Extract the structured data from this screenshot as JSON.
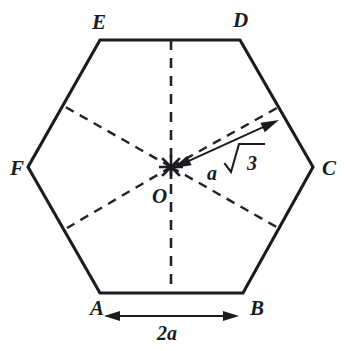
{
  "figure": {
    "shape": "regular-hexagon",
    "background_color": "#ffffff",
    "line_color": "#1b1b22"
  },
  "vertices": [
    {
      "key": "A",
      "label": "A",
      "x": 100,
      "y": 293,
      "label_x": 90,
      "label_y": 315
    },
    {
      "key": "B",
      "label": "B",
      "x": 243,
      "y": 293,
      "label_x": 250,
      "label_y": 315
    },
    {
      "key": "C",
      "label": "C",
      "x": 313,
      "y": 167,
      "label_x": 322,
      "label_y": 175
    },
    {
      "key": "D",
      "label": "D",
      "x": 240,
      "y": 40,
      "label_x": 233,
      "label_y": 27
    },
    {
      "key": "E",
      "label": "E",
      "x": 100,
      "y": 40,
      "label_x": 92,
      "label_y": 29
    },
    {
      "key": "F",
      "label": "F",
      "x": 28,
      "y": 167,
      "label_x": 10,
      "label_y": 175
    }
  ],
  "center": {
    "key": "O",
    "label": "O",
    "x": 171,
    "y": 167,
    "label_x": 152,
    "label_y": 203,
    "mark": "asterisk-cross"
  },
  "dimensions": {
    "base": {
      "label": "2a",
      "label_x": 157,
      "label_y": 340,
      "line_y": 316,
      "x_start": 104,
      "x_end": 239,
      "arrow": "double-headed"
    },
    "radius": {
      "label_a": "a",
      "label_radical": "√3",
      "label_full": "a √3",
      "label_x": 216,
      "label_y": 171,
      "from_x": 173,
      "from_y": 168,
      "to_x": 279,
      "to_y": 120,
      "arrow": "double-headed"
    }
  },
  "dashed_lines": [
    {
      "name": "vertical-axis",
      "x1": 171,
      "y1": 40,
      "x2": 171,
      "y2": 293
    },
    {
      "name": "diagonal-upper-left",
      "x1": 171,
      "y1": 167,
      "x2": 62,
      "y2": 105
    },
    {
      "name": "diagonal-lower-right",
      "x1": 171,
      "y1": 167,
      "x2": 280,
      "y2": 229
    },
    {
      "name": "diagonal-lower-left",
      "x1": 171,
      "y1": 167,
      "x2": 67,
      "y2": 228
    },
    {
      "name": "diagonal-upper-right",
      "x1": 171,
      "y1": 167,
      "x2": 277,
      "y2": 108
    }
  ]
}
